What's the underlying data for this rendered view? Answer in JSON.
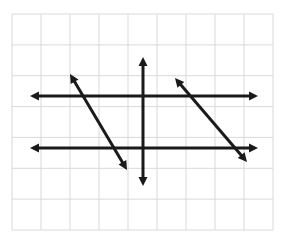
{
  "figure": {
    "width": 285,
    "height": 244,
    "background_color": "#ffffff"
  },
  "grid": {
    "color": "#d9d9d9",
    "border_color": "#d0d0d0",
    "stroke_width": 1,
    "x_start": 12,
    "y_start": 14,
    "x_end": 273,
    "y_end": 230,
    "columns": 9,
    "rows": 7,
    "cell_width": 29,
    "cell_height": 30.857,
    "x_lines": [
      12,
      41,
      70,
      99,
      128,
      157,
      186,
      215,
      244,
      273
    ],
    "y_lines": [
      14,
      44.9,
      75.7,
      106.6,
      137.4,
      168.3,
      199.1,
      230
    ]
  },
  "line_style": {
    "color": "#1a1a1a",
    "stroke_width": 3,
    "arrow_length": 9,
    "arrow_half_width": 4.5
  },
  "chart_data": {
    "type": "line",
    "xlabel": "",
    "ylabel": "",
    "grid": true,
    "legend": "none",
    "series": [
      {
        "name": "vertical-axis",
        "kind": "vertical-axis",
        "x1": 143,
        "y1": 57,
        "x2": 143,
        "y2": 186,
        "arrows": "both",
        "slope": "undefined"
      },
      {
        "name": "upper-horizontal-line",
        "kind": "horizontal-line",
        "x1": 30,
        "y1": 96,
        "x2": 258,
        "y2": 96,
        "arrows": "both",
        "slope": 0
      },
      {
        "name": "lower-horizontal-line",
        "kind": "horizontal-line",
        "x1": 30,
        "y1": 148,
        "x2": 258,
        "y2": 148,
        "arrows": "both",
        "slope": 0
      },
      {
        "name": "left-diagonal-line",
        "kind": "diagonal-line",
        "x1": 70,
        "y1": 74,
        "x2": 127,
        "y2": 170,
        "arrows": "both",
        "slope": -1.68
      },
      {
        "name": "right-diagonal-line",
        "kind": "diagonal-line",
        "x1": 175,
        "y1": 78,
        "x2": 247,
        "y2": 162,
        "arrows": "both",
        "slope": -1.17
      }
    ],
    "notes": [
      "Two horizontal parallel lines with arrowheads on both ends",
      "One vertical line (y-axis) with arrowheads on both ends",
      "Two parallel diagonal lines with negative slope, arrowheads on both ends"
    ]
  }
}
